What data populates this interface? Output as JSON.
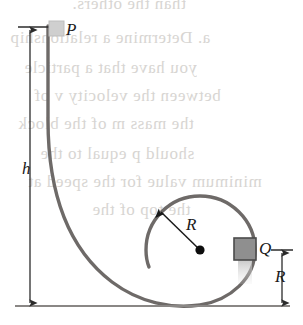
{
  "figure": {
    "labels": {
      "start_block": "P",
      "loop_block": "Q",
      "height_dimension": "h",
      "radius_dimension": "R",
      "loop_height_dimension": "R"
    },
    "colors": {
      "track": "#6e6a68",
      "ground": "#8a8785",
      "dimension": "#2b2b2b",
      "block_fill": "#8f8f8f",
      "block_stroke": "#4a4a4a",
      "start_block_fill": "#cfcfcf",
      "bleed_text": "#c9c6c2"
    },
    "geometry": {
      "loop_center_x": 200,
      "loop_center_y": 250,
      "loop_radius": 55,
      "ground_y": 306,
      "drop_top_y": 28,
      "drop_x": 48
    }
  },
  "bleed_text": {
    "lines": [
      "than the others.",
      "a. Determine a relationship",
      "you have that a particle",
      "between the velocity v of",
      "the mass m of the block",
      "should p equal to the",
      "minimum value for the speed at",
      "the top of the"
    ]
  }
}
